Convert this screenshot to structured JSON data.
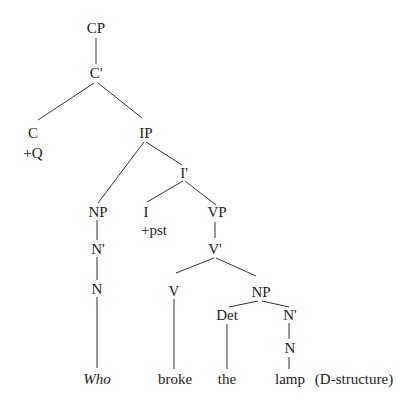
{
  "diagram": {
    "type": "syntax-tree",
    "annotation": "(D-structure)",
    "nodes": {
      "cp": "CP",
      "c_bar": "C'",
      "c": "C",
      "c_feature": "+Q",
      "ip": "IP",
      "i_bar": "I'",
      "np_subject": "NP",
      "n_bar_subject": "N'",
      "n_subject": "N",
      "i": "I",
      "i_feature": "+pst",
      "vp": "VP",
      "v_bar": "V'",
      "v": "V",
      "np_object": "NP",
      "det": "Det",
      "n_bar_object": "N'",
      "n_object": "N"
    },
    "words": {
      "who": "Who",
      "broke": "broke",
      "the": "the",
      "lamp": "lamp"
    },
    "colors": {
      "line": "#333333",
      "text": "#222222",
      "background": "#ffffff"
    }
  }
}
